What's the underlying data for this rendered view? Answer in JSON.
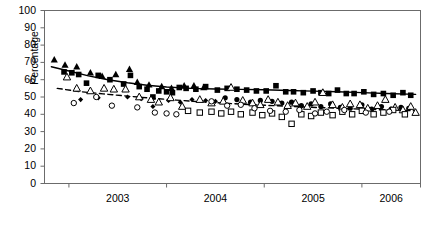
{
  "chart_data": {
    "type": "scatter",
    "title": "",
    "xlabel": "",
    "ylabel": "Percentage",
    "ylim": [
      0,
      100
    ],
    "ytick_labels": [
      "0",
      "10",
      "20",
      "30",
      "40",
      "50",
      "60",
      "70",
      "80",
      "90",
      "100"
    ],
    "ytick_values": [
      0,
      10,
      20,
      30,
      40,
      50,
      60,
      70,
      80,
      90,
      100
    ],
    "xtick_labels": [
      "2003",
      "2004",
      "2005",
      "2006"
    ],
    "xtick_values": [
      2003,
      2004,
      2005,
      2006
    ],
    "xlim": [
      2002.75,
      2006.6
    ],
    "grid": false,
    "legend": "none",
    "axis_color": "#6b6b6b",
    "series": [
      {
        "name": "filled-square",
        "marker": "filled-square",
        "color": "#000000",
        "points": [
          [
            2002.95,
            64.5
          ],
          [
            2003.03,
            64.0
          ],
          [
            2003.1,
            63.0
          ],
          [
            2003.18,
            58.0
          ],
          [
            2003.3,
            62.5
          ],
          [
            2003.42,
            60.0
          ],
          [
            2003.56,
            57.5
          ],
          [
            2003.63,
            62.5
          ],
          [
            2003.72,
            56.0
          ],
          [
            2003.8,
            54.5
          ],
          [
            2003.86,
            50.0
          ],
          [
            2003.92,
            53.5
          ],
          [
            2004.0,
            53.0
          ],
          [
            2004.06,
            52.5
          ],
          [
            2004.13,
            55.5
          ],
          [
            2004.2,
            55.0
          ],
          [
            2004.3,
            54.5
          ],
          [
            2004.4,
            56.0
          ],
          [
            2004.52,
            54.0
          ],
          [
            2004.62,
            55.0
          ],
          [
            2004.72,
            54.5
          ],
          [
            2004.82,
            54.0
          ],
          [
            2004.92,
            53.5
          ],
          [
            2005.02,
            53.5
          ],
          [
            2005.12,
            56.5
          ],
          [
            2005.22,
            53.0
          ],
          [
            2005.3,
            53.0
          ],
          [
            2005.4,
            52.5
          ],
          [
            2005.5,
            53.5
          ],
          [
            2005.58,
            52.5
          ],
          [
            2005.66,
            52.0
          ],
          [
            2005.75,
            54.0
          ],
          [
            2005.84,
            52.0
          ],
          [
            2005.92,
            52.0
          ],
          [
            2006.02,
            53.0
          ],
          [
            2006.12,
            51.5
          ],
          [
            2006.22,
            52.0
          ],
          [
            2006.32,
            51.0
          ],
          [
            2006.42,
            52.5
          ],
          [
            2006.5,
            51.0
          ]
        ]
      },
      {
        "name": "filled-triangle",
        "marker": "filled-triangle",
        "color": "#000000",
        "points": [
          [
            2002.85,
            71.5
          ],
          [
            2002.96,
            68.5
          ],
          [
            2003.08,
            67.5
          ],
          [
            2003.22,
            64.0
          ],
          [
            2003.34,
            62.0
          ],
          [
            2003.48,
            63.0
          ],
          [
            2003.62,
            66.0
          ],
          [
            2003.7,
            58.5
          ],
          [
            2003.82,
            57.0
          ],
          [
            2003.95,
            56.0
          ],
          [
            2004.05,
            55.0
          ],
          [
            2004.18,
            56.5
          ],
          [
            2004.28,
            56.5
          ],
          [
            2004.38,
            55.5
          ]
        ]
      },
      {
        "name": "filled-circle",
        "marker": "filled-circle",
        "color": "#000000",
        "points": [
          [
            2004.6,
            49.5
          ],
          [
            2004.72,
            48.5
          ],
          [
            2004.86,
            47.0
          ],
          [
            2004.96,
            48.0
          ],
          [
            2005.08,
            47.5
          ],
          [
            2005.18,
            46.5
          ],
          [
            2005.28,
            47.0
          ],
          [
            2005.38,
            45.0
          ],
          [
            2005.48,
            46.0
          ],
          [
            2005.58,
            44.5
          ],
          [
            2005.68,
            46.0
          ],
          [
            2005.78,
            44.0
          ],
          [
            2005.88,
            43.5
          ],
          [
            2006.0,
            45.5
          ],
          [
            2006.1,
            43.0
          ],
          [
            2006.2,
            44.5
          ],
          [
            2006.3,
            43.0
          ],
          [
            2006.4,
            44.0
          ],
          [
            2006.48,
            43.5
          ]
        ]
      },
      {
        "name": "filled-diamond",
        "marker": "filled-diamond",
        "color": "#000000",
        "points": [
          [
            2003.12,
            48.5
          ],
          [
            2003.3,
            49.5
          ],
          [
            2003.6,
            50.0
          ],
          [
            2003.74,
            49.0
          ],
          [
            2003.86,
            44.5
          ],
          [
            2004.02,
            48.0
          ],
          [
            2004.14,
            47.0
          ],
          [
            2004.26,
            48.5
          ],
          [
            2004.4,
            48.0
          ],
          [
            2004.5,
            47.5
          ]
        ]
      },
      {
        "name": "open-triangle",
        "marker": "open-triangle",
        "color": "#000000",
        "points": [
          [
            2002.98,
            61.5
          ],
          [
            2003.08,
            55.0
          ],
          [
            2003.22,
            53.5
          ],
          [
            2003.36,
            55.0
          ],
          [
            2003.46,
            54.5
          ],
          [
            2003.58,
            54.5
          ],
          [
            2003.72,
            50.0
          ],
          [
            2003.84,
            48.5
          ],
          [
            2003.92,
            47.0
          ],
          [
            2004.04,
            49.5
          ],
          [
            2004.16,
            44.5
          ],
          [
            2004.34,
            48.5
          ],
          [
            2004.46,
            46.5
          ],
          [
            2004.58,
            47.5
          ],
          [
            2004.66,
            55.5
          ],
          [
            2004.78,
            48.0
          ],
          [
            2004.88,
            46.5
          ],
          [
            2004.96,
            45.5
          ],
          [
            2005.04,
            48.5
          ],
          [
            2005.14,
            47.0
          ],
          [
            2005.24,
            45.0
          ],
          [
            2005.32,
            46.5
          ],
          [
            2005.44,
            44.5
          ],
          [
            2005.52,
            47.0
          ],
          [
            2005.6,
            52.5
          ],
          [
            2005.7,
            45.5
          ],
          [
            2005.8,
            44.0
          ],
          [
            2005.88,
            46.0
          ],
          [
            2005.98,
            45.5
          ],
          [
            2006.06,
            43.5
          ],
          [
            2006.16,
            45.0
          ],
          [
            2006.24,
            48.5
          ],
          [
            2006.34,
            44.0
          ],
          [
            2006.42,
            42.5
          ],
          [
            2006.5,
            44.5
          ],
          [
            2006.55,
            41.0
          ]
        ]
      },
      {
        "name": "open-square",
        "marker": "open-square",
        "color": "#000000",
        "points": [
          [
            2004.22,
            42.0
          ],
          [
            2004.34,
            41.0
          ],
          [
            2004.46,
            41.5
          ],
          [
            2004.56,
            40.5
          ],
          [
            2004.66,
            41.5
          ],
          [
            2004.76,
            40.0
          ],
          [
            2004.88,
            41.0
          ],
          [
            2004.98,
            39.5
          ],
          [
            2005.08,
            40.5
          ],
          [
            2005.18,
            38.5
          ],
          [
            2005.28,
            34.5
          ],
          [
            2005.38,
            40.0
          ],
          [
            2005.48,
            39.0
          ],
          [
            2005.58,
            41.0
          ],
          [
            2005.7,
            39.5
          ],
          [
            2005.8,
            41.5
          ],
          [
            2005.9,
            40.0
          ],
          [
            2006.0,
            42.0
          ],
          [
            2006.12,
            40.0
          ],
          [
            2006.22,
            41.0
          ],
          [
            2006.32,
            42.5
          ],
          [
            2006.44,
            40.0
          ]
        ]
      },
      {
        "name": "open-circle",
        "marker": "open-circle",
        "color": "#000000",
        "points": [
          [
            2003.05,
            46.5
          ],
          [
            2003.28,
            50.0
          ],
          [
            2003.44,
            45.0
          ],
          [
            2003.7,
            44.0
          ],
          [
            2003.88,
            41.0
          ],
          [
            2004.0,
            40.5
          ],
          [
            2004.1,
            40.0
          ],
          [
            2004.46,
            47.5
          ],
          [
            2004.62,
            45.0
          ],
          [
            2004.76,
            45.5
          ],
          [
            2004.9,
            43.5
          ],
          [
            2005.06,
            42.0
          ],
          [
            2005.22,
            41.5
          ],
          [
            2005.36,
            42.5
          ],
          [
            2005.52,
            40.5
          ],
          [
            2005.64,
            41.5
          ],
          [
            2005.82,
            42.5
          ],
          [
            2006.04,
            41.0
          ],
          [
            2006.28,
            41.5
          ]
        ]
      }
    ],
    "trend_lines": [
      {
        "name": "solid-trend",
        "style": "solid",
        "color": "#000000",
        "points": [
          [
            2002.82,
            67.5
          ],
          [
            2003.0,
            65.0
          ],
          [
            2003.2,
            62.2
          ],
          [
            2003.4,
            60.0
          ],
          [
            2003.6,
            58.2
          ],
          [
            2003.8,
            56.8
          ],
          [
            2004.0,
            55.8
          ],
          [
            2004.25,
            55.0
          ],
          [
            2004.5,
            54.6
          ],
          [
            2004.75,
            54.4
          ],
          [
            2005.0,
            54.2
          ],
          [
            2005.25,
            53.8
          ],
          [
            2005.5,
            53.4
          ],
          [
            2005.75,
            53.0
          ],
          [
            2006.0,
            52.5
          ],
          [
            2006.25,
            52.0
          ],
          [
            2006.55,
            51.5
          ]
        ]
      },
      {
        "name": "dashed-trend",
        "style": "dashed",
        "color": "#000000",
        "points": [
          [
            2002.88,
            55.0
          ],
          [
            2003.1,
            53.2
          ],
          [
            2003.35,
            51.8
          ],
          [
            2003.6,
            50.5
          ],
          [
            2003.85,
            49.3
          ],
          [
            2004.1,
            48.2
          ],
          [
            2004.35,
            47.2
          ],
          [
            2004.6,
            46.4
          ],
          [
            2004.85,
            45.6
          ],
          [
            2005.1,
            45.0
          ],
          [
            2005.35,
            44.4
          ],
          [
            2005.6,
            43.8
          ],
          [
            2005.85,
            43.3
          ],
          [
            2006.1,
            42.8
          ],
          [
            2006.35,
            42.4
          ],
          [
            2006.55,
            42.0
          ]
        ]
      }
    ]
  }
}
